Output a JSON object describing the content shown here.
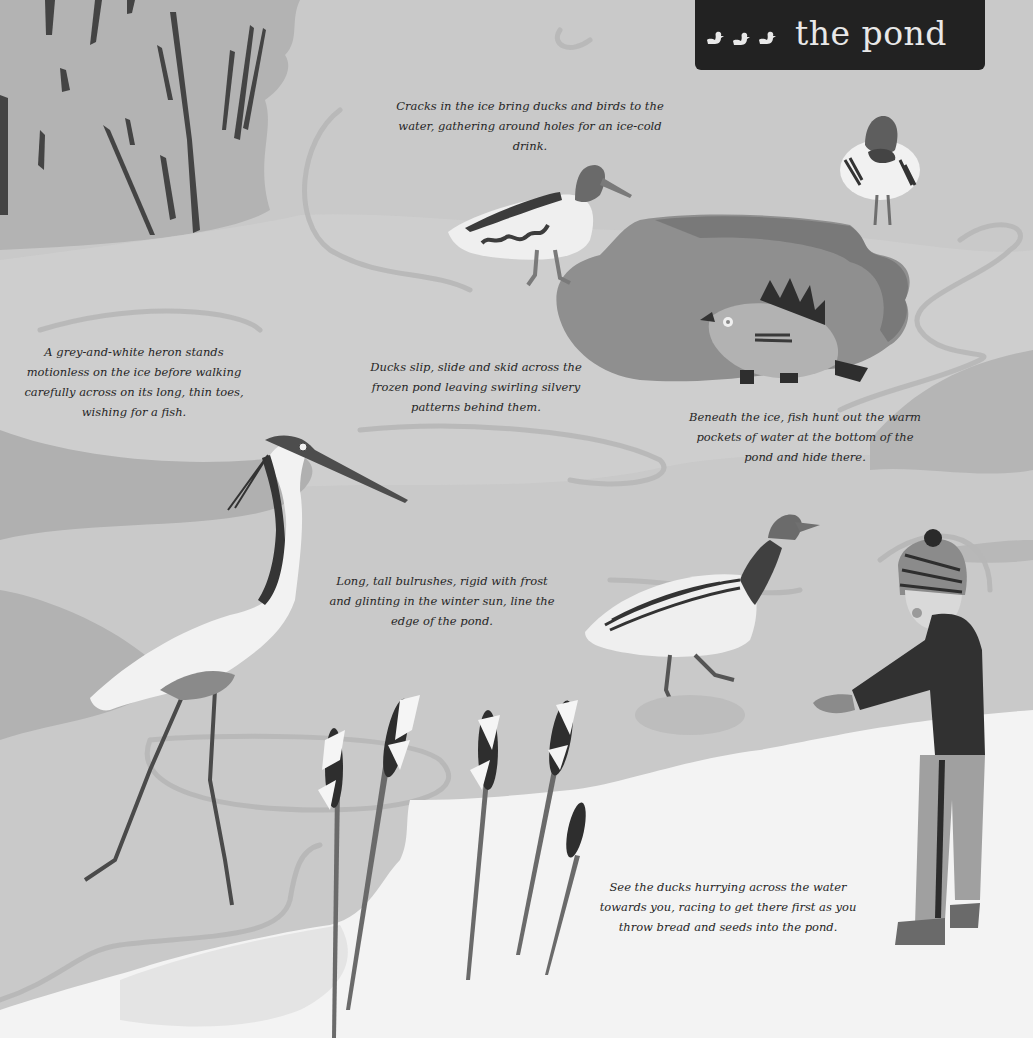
{
  "page": {
    "title": "the pond",
    "title_icon": "three-ducklings-icon",
    "colors": {
      "background_ice": "#c8c8c8",
      "water_dark": "#8f8f8f",
      "snow": "#f4f4f4",
      "title_box": "#222222",
      "title_text": "#e8e8e8",
      "ink": "#3a3a3a"
    }
  },
  "captions": {
    "cracks": "Cracks in the ice bring ducks and birds to the water, gathering around holes for an ice-cold drink.",
    "heron": "A grey-and-white heron stands motionless on the ice before walking carefully across on its long, thin toes, wishing for a fish.",
    "ducks_slide": "Ducks slip, slide and skid across the frozen pond leaving swirling silvery patterns behind them.",
    "fish": "Beneath the ice, fish hunt out the warm pockets of water at the bottom of the pond and hide there.",
    "bulrushes": "Long, tall bulrushes, rigid with frost and glinting in the winter sun, line the edge of the pond.",
    "feeding": "See the ducks hurrying across the water towards you, racing to get there first as you throw bread and seeds into the pond."
  },
  "illustrations": [
    {
      "name": "reeds",
      "label": "bulrush reeds top-left"
    },
    {
      "name": "shelduck",
      "label": "duck walking on ice"
    },
    {
      "name": "mallard-front",
      "label": "duck facing forward"
    },
    {
      "name": "ice-hole",
      "label": "water hole in ice"
    },
    {
      "name": "fish",
      "label": "fish under ice"
    },
    {
      "name": "heron",
      "label": "grey heron"
    },
    {
      "name": "mallard-walking",
      "label": "mallard skidding"
    },
    {
      "name": "child",
      "label": "child in bobble hat feeding ducks"
    },
    {
      "name": "bulrushes",
      "label": "frosted bulrushes"
    }
  ]
}
